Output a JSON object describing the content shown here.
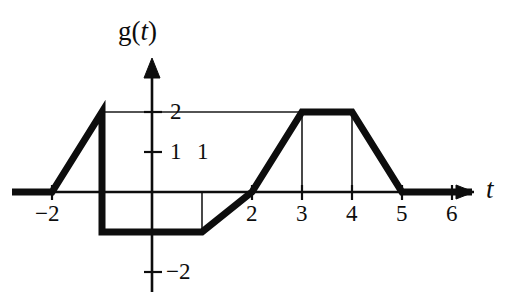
{
  "figure": {
    "kind": "function-graph",
    "axis_labels": {
      "y_axis": "g(t)",
      "y_axis_prefix": "g(",
      "y_axis_var": "t",
      "y_axis_suffix": ")",
      "x_axis": "t"
    },
    "line_color": "#0d0d0d",
    "background_color": "#ffffff",
    "guide_color": "#1a1a1a"
  },
  "chart_data": {
    "type": "line",
    "title": "",
    "xlabel": "t",
    "ylabel": "g(t)",
    "xlim": [
      -2.8,
      6.8
    ],
    "ylim": [
      -2.4,
      2.6
    ],
    "grid": false,
    "legend": null,
    "x_ticks": [
      -2,
      1,
      2,
      3,
      4,
      5,
      6
    ],
    "x_tick_labels": [
      "−2",
      "1",
      "2",
      "3",
      "4",
      "5",
      "6"
    ],
    "y_ticks": [
      -2,
      1,
      2
    ],
    "y_tick_labels": [
      "−2",
      "1",
      "2"
    ],
    "series": [
      {
        "name": "g(t)",
        "x": [
          -2.8,
          -2,
          -1,
          -1,
          1,
          2,
          3,
          4,
          5,
          6.4
        ],
        "y": [
          0,
          0,
          2,
          -1,
          -1,
          0,
          2,
          2,
          0,
          0
        ]
      }
    ],
    "annotations": [
      {
        "type": "guide-horizontal",
        "y": 2,
        "x_from": -1,
        "x_to": 3
      },
      {
        "type": "guide-vertical",
        "x": 1,
        "y_from": 0,
        "y_to": -1
      },
      {
        "type": "guide-vertical",
        "x": 3,
        "y_from": 0,
        "y_to": 2
      },
      {
        "type": "guide-vertical",
        "x": 4,
        "y_from": 0,
        "y_to": 2
      }
    ]
  }
}
